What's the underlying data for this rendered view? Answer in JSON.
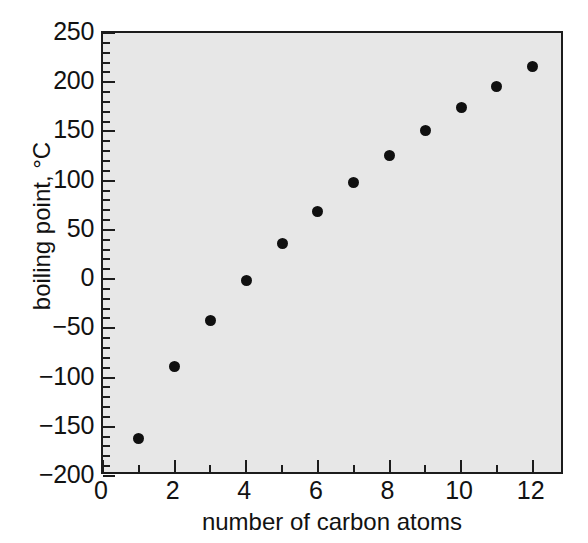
{
  "chart_data": {
    "type": "scatter",
    "title": "",
    "xlabel": "number of carbon atoms",
    "ylabel": "boiling point, °C",
    "xlim": [
      0,
      12.9
    ],
    "ylim": [
      -200,
      250
    ],
    "grid": false,
    "legend": null,
    "x_major_ticks": [
      0,
      2,
      4,
      6,
      8,
      10,
      12
    ],
    "x_major_tick_labels": [
      "0",
      "2",
      "4",
      "6",
      "8",
      "10",
      "12"
    ],
    "x_minor_ticks": [
      1,
      3,
      5,
      7,
      9,
      11
    ],
    "y_major_ticks": [
      -200,
      -150,
      -100,
      -50,
      0,
      50,
      100,
      150,
      200,
      250
    ],
    "y_major_tick_labels": [
      "−200",
      "−150",
      "−100",
      "−50",
      "0",
      "50",
      "100",
      "150",
      "200",
      "250"
    ],
    "y_minor_ticks": [
      -190,
      -180,
      -170,
      -160,
      -140,
      -130,
      -120,
      -110,
      -90,
      -80,
      -70,
      -60,
      -40,
      -30,
      -20,
      -10,
      10,
      20,
      30,
      40,
      60,
      70,
      80,
      90,
      110,
      120,
      130,
      140,
      160,
      170,
      180,
      190,
      210,
      220,
      230,
      240
    ],
    "x": [
      1,
      2,
      3,
      4,
      5,
      6,
      7,
      8,
      9,
      10,
      11,
      12
    ],
    "y": [
      -162,
      -89,
      -42,
      -1,
      36,
      69,
      98,
      126,
      151,
      174,
      196,
      216
    ],
    "marker": "filled-circle",
    "marker_color": "#101010",
    "plot_background": "#e7e7e7",
    "frame_color": "#1c1c1c"
  }
}
